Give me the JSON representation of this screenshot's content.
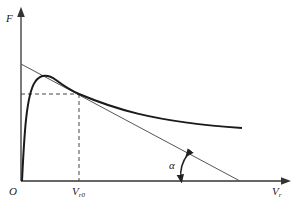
{
  "diagram": {
    "type": "force-velocity characteristic curve with tangent",
    "axes": {
      "y_label": "F",
      "x_label_main": "V",
      "x_label_sub": "r",
      "origin_label": "O"
    },
    "annotations": {
      "v_marker_main": "V",
      "v_marker_sub": "r0",
      "angle_label": "α"
    },
    "colors": {
      "curve": "#1a1a1a",
      "tangent": "#555555",
      "axes": "#333333",
      "dashed": "#444444"
    }
  }
}
